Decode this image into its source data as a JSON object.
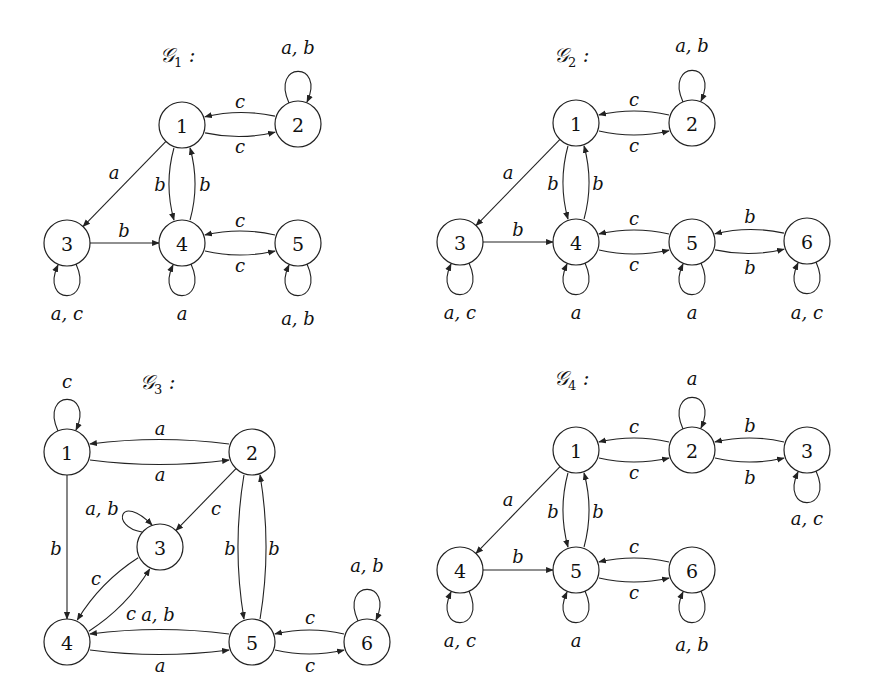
{
  "graphs": [
    {
      "id": "G1",
      "title": "𝒢",
      "subscript": "1",
      "title_pos": [
        160,
        62
      ],
      "nodes": [
        {
          "id": "1",
          "x": 182,
          "y": 125
        },
        {
          "id": "2",
          "x": 298,
          "y": 124
        },
        {
          "id": "3",
          "x": 67,
          "y": 243
        },
        {
          "id": "4",
          "x": 182,
          "y": 243
        },
        {
          "id": "5",
          "x": 298,
          "y": 243
        }
      ],
      "edges": [
        {
          "from": "1",
          "to": "2",
          "label": "c",
          "bend": -8,
          "lx": 240,
          "ly": 101
        },
        {
          "from": "2",
          "to": "1",
          "label": "c",
          "bend": -8,
          "lx": 240,
          "ly": 146
        },
        {
          "from": "1",
          "to": "3",
          "label": "a",
          "bend": 0,
          "lx": 114,
          "ly": 172
        },
        {
          "from": "4",
          "to": "1",
          "label": "b",
          "bend": -10,
          "lx": 160,
          "ly": 184
        },
        {
          "from": "1",
          "to": "4",
          "label": "b",
          "bend": -10,
          "lx": 205,
          "ly": 184
        },
        {
          "from": "3",
          "to": "4",
          "label": "b",
          "bend": 0,
          "lx": 124,
          "ly": 230
        },
        {
          "from": "4",
          "to": "5",
          "label": "c",
          "bend": -8,
          "lx": 240,
          "ly": 220
        },
        {
          "from": "5",
          "to": "4",
          "label": "c",
          "bend": -8,
          "lx": 240,
          "ly": 265
        }
      ],
      "loops": [
        {
          "node": "2",
          "dir": "up",
          "label": "a, b",
          "lx": 298,
          "ly": 47
        },
        {
          "node": "3",
          "dir": "down",
          "label": "a, c",
          "lx": 67,
          "ly": 313
        },
        {
          "node": "4",
          "dir": "down",
          "label": "a",
          "lx": 182,
          "ly": 313
        },
        {
          "node": "5",
          "dir": "down",
          "label": "a, b",
          "lx": 298,
          "ly": 318
        }
      ]
    },
    {
      "id": "G2",
      "title": "𝒢",
      "subscript": "2",
      "title_pos": [
        554,
        62
      ],
      "nodes": [
        {
          "id": "1",
          "x": 576,
          "y": 123
        },
        {
          "id": "2",
          "x": 692,
          "y": 123
        },
        {
          "id": "3",
          "x": 460,
          "y": 242
        },
        {
          "id": "4",
          "x": 576,
          "y": 242
        },
        {
          "id": "5",
          "x": 692,
          "y": 242
        },
        {
          "id": "6",
          "x": 807,
          "y": 241
        }
      ],
      "edges": [
        {
          "from": "1",
          "to": "2",
          "label": "c",
          "bend": -8,
          "lx": 634,
          "ly": 99
        },
        {
          "from": "2",
          "to": "1",
          "label": "c",
          "bend": -8,
          "lx": 634,
          "ly": 145
        },
        {
          "from": "1",
          "to": "3",
          "label": "a",
          "bend": 0,
          "lx": 508,
          "ly": 172
        },
        {
          "from": "4",
          "to": "1",
          "label": "b",
          "bend": -10,
          "lx": 553,
          "ly": 183
        },
        {
          "from": "1",
          "to": "4",
          "label": "b",
          "bend": -10,
          "lx": 598,
          "ly": 183
        },
        {
          "from": "3",
          "to": "4",
          "label": "b",
          "bend": 0,
          "lx": 518,
          "ly": 229
        },
        {
          "from": "4",
          "to": "5",
          "label": "c",
          "bend": -8,
          "lx": 634,
          "ly": 218
        },
        {
          "from": "5",
          "to": "4",
          "label": "c",
          "bend": -8,
          "lx": 634,
          "ly": 264
        },
        {
          "from": "5",
          "to": "6",
          "label": "b",
          "bend": -8,
          "lx": 750,
          "ly": 216
        },
        {
          "from": "6",
          "to": "5",
          "label": "b",
          "bend": -8,
          "lx": 750,
          "ly": 267
        }
      ],
      "loops": [
        {
          "node": "2",
          "dir": "up",
          "label": "a, b",
          "lx": 692,
          "ly": 45
        },
        {
          "node": "3",
          "dir": "down",
          "label": "a, c",
          "lx": 460,
          "ly": 312
        },
        {
          "node": "4",
          "dir": "down",
          "label": "a",
          "lx": 576,
          "ly": 312
        },
        {
          "node": "5",
          "dir": "down",
          "label": "a",
          "lx": 692,
          "ly": 312
        },
        {
          "node": "6",
          "dir": "down",
          "label": "a, c",
          "lx": 807,
          "ly": 312
        }
      ]
    },
    {
      "id": "G3",
      "title": "𝒢",
      "subscript": "3",
      "title_pos": [
        140,
        389
      ],
      "nodes": [
        {
          "id": "1",
          "x": 67,
          "y": 452
        },
        {
          "id": "2",
          "x": 252,
          "y": 452
        },
        {
          "id": "3",
          "x": 160,
          "y": 547
        },
        {
          "id": "4",
          "x": 67,
          "y": 642
        },
        {
          "id": "5",
          "x": 252,
          "y": 642
        },
        {
          "id": "6",
          "x": 367,
          "y": 642
        }
      ],
      "edges": [
        {
          "from": "1",
          "to": "2",
          "label": "a",
          "bend": -9,
          "lx": 160,
          "ly": 428
        },
        {
          "from": "2",
          "to": "1",
          "label": "a",
          "bend": -9,
          "lx": 160,
          "ly": 474
        },
        {
          "from": "1",
          "to": "4",
          "label": "b",
          "bend": 0,
          "lx": 56,
          "ly": 548
        },
        {
          "from": "2",
          "to": "3",
          "label": "c",
          "bend": 0,
          "lx": 216,
          "ly": 508
        },
        {
          "from": "5",
          "to": "2",
          "label": "b",
          "bend": -12,
          "lx": 230,
          "ly": 548
        },
        {
          "from": "2",
          "to": "5",
          "label": "b",
          "bend": -12,
          "lx": 274,
          "ly": 548
        },
        {
          "from": "4",
          "to": "3",
          "label": "c",
          "bend": -10,
          "lx": 96,
          "ly": 578
        },
        {
          "from": "3",
          "to": "4",
          "label": "c",
          "bend": -10,
          "lx": 131,
          "ly": 613
        },
        {
          "from": "4",
          "to": "5",
          "label": "a, b",
          "bend": -9,
          "lx": 158,
          "ly": 614
        },
        {
          "from": "5",
          "to": "4",
          "label": "a",
          "bend": -9,
          "lx": 160,
          "ly": 665
        },
        {
          "from": "5",
          "to": "6",
          "label": "c",
          "bend": -8,
          "lx": 310,
          "ly": 617
        },
        {
          "from": "6",
          "to": "5",
          "label": "c",
          "bend": -8,
          "lx": 310,
          "ly": 665
        }
      ],
      "loops": [
        {
          "node": "1",
          "dir": "up",
          "label": "c",
          "lx": 67,
          "ly": 381
        },
        {
          "node": "3",
          "dir": "upleft",
          "label": "a, b",
          "lx": 102,
          "ly": 508
        },
        {
          "node": "6",
          "dir": "up",
          "label": "a, b",
          "lx": 367,
          "ly": 565
        }
      ]
    },
    {
      "id": "G4",
      "title": "𝒢",
      "subscript": "4",
      "title_pos": [
        554,
        385
      ],
      "nodes": [
        {
          "id": "1",
          "x": 576,
          "y": 450
        },
        {
          "id": "2",
          "x": 692,
          "y": 450
        },
        {
          "id": "3",
          "x": 807,
          "y": 450
        },
        {
          "id": "4",
          "x": 460,
          "y": 570
        },
        {
          "id": "5",
          "x": 576,
          "y": 570
        },
        {
          "id": "6",
          "x": 692,
          "y": 570
        }
      ],
      "edges": [
        {
          "from": "1",
          "to": "2",
          "label": "c",
          "bend": -8,
          "lx": 634,
          "ly": 426
        },
        {
          "from": "2",
          "to": "1",
          "label": "c",
          "bend": -8,
          "lx": 634,
          "ly": 472
        },
        {
          "from": "2",
          "to": "3",
          "label": "b",
          "bend": -8,
          "lx": 750,
          "ly": 425
        },
        {
          "from": "3",
          "to": "2",
          "label": "b",
          "bend": -8,
          "lx": 750,
          "ly": 477
        },
        {
          "from": "1",
          "to": "4",
          "label": "a",
          "bend": 0,
          "lx": 508,
          "ly": 499
        },
        {
          "from": "5",
          "to": "1",
          "label": "b",
          "bend": -10,
          "lx": 553,
          "ly": 511
        },
        {
          "from": "1",
          "to": "5",
          "label": "b",
          "bend": -10,
          "lx": 598,
          "ly": 511
        },
        {
          "from": "4",
          "to": "5",
          "label": "b",
          "bend": 0,
          "lx": 518,
          "ly": 556
        },
        {
          "from": "5",
          "to": "6",
          "label": "c",
          "bend": -8,
          "lx": 634,
          "ly": 546
        },
        {
          "from": "6",
          "to": "5",
          "label": "c",
          "bend": -8,
          "lx": 634,
          "ly": 592
        }
      ],
      "loops": [
        {
          "node": "2",
          "dir": "up",
          "label": "a",
          "lx": 692,
          "ly": 378
        },
        {
          "node": "3",
          "dir": "down",
          "label": "a, c",
          "lx": 807,
          "ly": 518
        },
        {
          "node": "4",
          "dir": "down",
          "label": "a, c",
          "lx": 460,
          "ly": 640
        },
        {
          "node": "5",
          "dir": "down",
          "label": "a",
          "lx": 576,
          "ly": 640
        },
        {
          "node": "6",
          "dir": "down",
          "label": "a, b",
          "lx": 692,
          "ly": 644
        }
      ]
    }
  ],
  "style": {
    "stroke": "#222222",
    "node_fill": "#ffffff",
    "background": "#ffffff",
    "node_radius": 23
  }
}
